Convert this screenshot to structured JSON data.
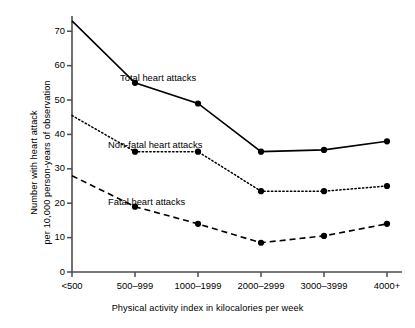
{
  "chart_data": {
    "type": "line",
    "title": "",
    "xlabel": "Physical activity index in kilocalories per week",
    "ylabel_line1": "Number with heart attack",
    "ylabel_line2": "per 10,000 person-years of observation",
    "categories": [
      "<500",
      "500–999",
      "1000–1999",
      "2000–2999",
      "3000–3999",
      "4000+"
    ],
    "ylim": [
      0,
      74
    ],
    "yticks": [
      0,
      10,
      20,
      30,
      40,
      50,
      60,
      70
    ],
    "ytick_labels": [
      "0",
      "10",
      "20",
      "30",
      "40",
      "50",
      "60",
      "70"
    ],
    "grid": false,
    "legend_position": "inline-annotations",
    "series": [
      {
        "name": "Total heart attacks",
        "style": "solid",
        "color": "#000000",
        "marker": "filled-circle",
        "values": [
          73,
          55,
          49,
          35,
          35.5,
          38
        ],
        "label_x": 120,
        "label_y": 72
      },
      {
        "name": "Non-fatal heart attacks",
        "style": "dotted",
        "color": "#000000",
        "marker": "filled-circle",
        "values": [
          45.5,
          35,
          35,
          23.5,
          23.5,
          25
        ],
        "label_x": 108,
        "label_y": 139
      },
      {
        "name": "Fatal heart attacks",
        "style": "dashed",
        "color": "#000000",
        "marker": "filled-circle",
        "values": [
          28,
          19,
          14,
          8.5,
          10.5,
          14
        ],
        "label_x": 108,
        "label_y": 196
      }
    ]
  },
  "axis": {
    "color": "#4d4d4d"
  }
}
